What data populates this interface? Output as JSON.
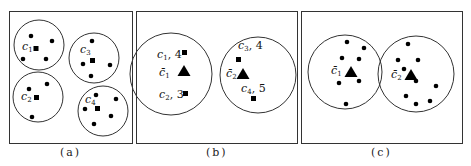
{
  "figure": {
    "panels": [
      {
        "id": "a",
        "caption": "(a)",
        "clusters": [
          {
            "label": "c",
            "sub": "1",
            "value": ""
          },
          {
            "label": "c",
            "sub": "3",
            "value": ""
          },
          {
            "label": "c",
            "sub": "2",
            "value": ""
          },
          {
            "label": "c",
            "sub": "4",
            "value": ""
          }
        ]
      },
      {
        "id": "b",
        "caption": "(b)",
        "groups": [
          {
            "centroid": {
              "label": "c̄",
              "sub": "1"
            },
            "members": [
              {
                "label": "c",
                "sub": "1",
                "value": ", 4"
              },
              {
                "label": "c",
                "sub": "2",
                "value": ", 3"
              }
            ]
          },
          {
            "centroid": {
              "label": "c̄",
              "sub": "2"
            },
            "members": [
              {
                "label": "c",
                "sub": "3",
                "value": ", 4"
              },
              {
                "label": "c",
                "sub": "4",
                "value": ", 5"
              }
            ]
          }
        ]
      },
      {
        "id": "c",
        "caption": "(c)",
        "groups": [
          {
            "centroid": {
              "label": "c̄",
              "sub": "1"
            },
            "point_count": 8
          },
          {
            "centroid": {
              "label": "c̄",
              "sub": "2"
            },
            "point_count": 10
          }
        ]
      }
    ],
    "colors": {
      "stroke": "#333333",
      "marker": "#000000",
      "background": "#ffffff"
    }
  }
}
